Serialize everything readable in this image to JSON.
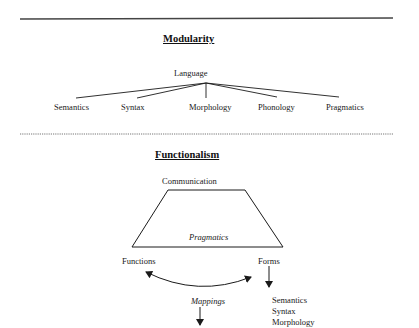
{
  "modularity": {
    "title": "Modularity",
    "root": "Language",
    "children": [
      "Semantics",
      "Syntax",
      "Morphology",
      "Phonology",
      "Pragmatics"
    ]
  },
  "functionalism": {
    "title": "Functionalism",
    "top": "Communication",
    "middle": "Pragmatics",
    "left": "Functions",
    "right": "Forms",
    "link": "Mappings",
    "forms_list": [
      "Semantics",
      "Syntax",
      "Morphology"
    ]
  },
  "colors": {
    "ink": "#1a1a1a",
    "divider": "#555555",
    "background": "#ffffff"
  }
}
